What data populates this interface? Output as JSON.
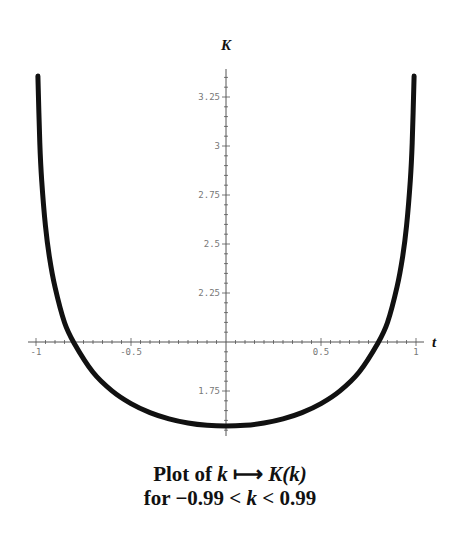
{
  "chart_data": {
    "type": "line",
    "xlabel": "t",
    "ylabel": "K",
    "xlim": [
      -1.05,
      1.05
    ],
    "ylim": [
      1.55,
      3.4
    ],
    "axes_origin": {
      "x": 0,
      "y": 2
    },
    "grid": false,
    "legend": null,
    "x_ticks": [
      {
        "value": -1,
        "label": "-1"
      },
      {
        "value": -0.5,
        "label": "-0.5"
      },
      {
        "value": 0.5,
        "label": "0.5"
      },
      {
        "value": 1,
        "label": "1"
      }
    ],
    "y_ticks": [
      {
        "value": 1.75,
        "label": "1.75"
      },
      {
        "value": 2.25,
        "label": "2.25"
      },
      {
        "value": 2.5,
        "label": "2.5"
      },
      {
        "value": 2.75,
        "label": "2.75"
      },
      {
        "value": 3,
        "label": "3"
      },
      {
        "value": 3.25,
        "label": "3.25"
      }
    ],
    "series": [
      {
        "name": "K(k)",
        "color": "#111111",
        "x": [
          -0.99,
          -0.98,
          -0.97,
          -0.95,
          -0.93,
          -0.9,
          -0.85,
          -0.8,
          -0.7,
          -0.6,
          -0.5,
          -0.4,
          -0.3,
          -0.2,
          -0.1,
          0,
          0.1,
          0.2,
          0.3,
          0.4,
          0.5,
          0.6,
          0.7,
          0.8,
          0.85,
          0.9,
          0.93,
          0.95,
          0.97,
          0.98,
          0.99
        ],
        "y": [
          3.3566,
          3.0161,
          2.8237,
          2.59,
          2.4372,
          2.2805,
          2.0995,
          1.9953,
          1.8457,
          1.7508,
          1.6858,
          1.64,
          1.608,
          1.5869,
          1.5747,
          1.5708,
          1.5747,
          1.5869,
          1.608,
          1.64,
          1.6858,
          1.7508,
          1.8457,
          1.9953,
          2.0995,
          2.2805,
          2.4372,
          2.59,
          2.8237,
          3.0161,
          3.3566
        ]
      }
    ]
  },
  "caption": {
    "line1_prefix": "Plot of ",
    "line1_var": "k",
    "line1_arrow": " ⟼ ",
    "line1_func": "K(k)",
    "line2_prefix": "for −0.99 < ",
    "line2_var": "k",
    "line2_suffix": " < 0.99"
  }
}
